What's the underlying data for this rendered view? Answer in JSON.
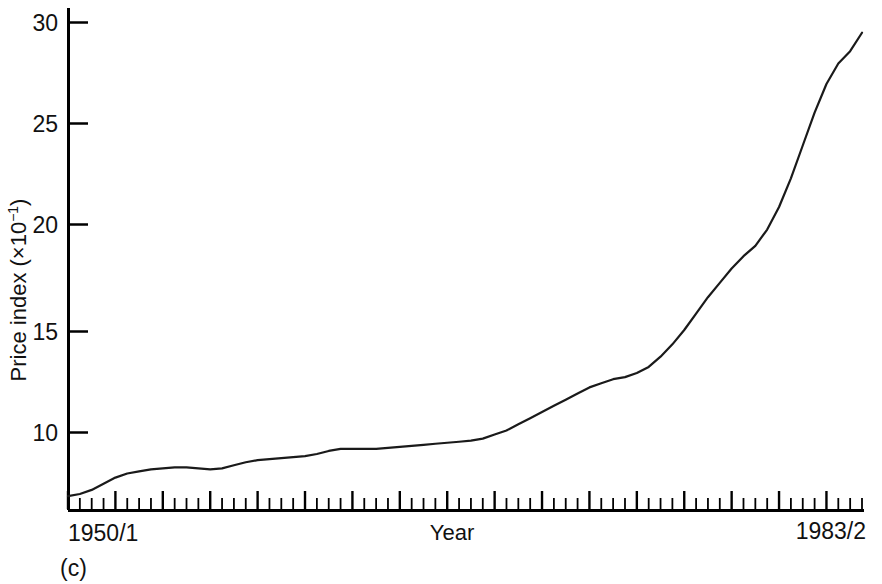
{
  "figure": {
    "caption": "(c)",
    "background_color": "#ffffff",
    "line_color": "#1a1a1a",
    "axis_color": "#000000"
  },
  "chart_data": {
    "type": "line",
    "title": "",
    "subtitle": "",
    "xlabel": "Year",
    "ylabel": "Price index (×10",
    "ylabel_exponent": "−1",
    "ylabel_suffix": ")",
    "ylabel_full": "Price index (×10⁻¹)",
    "grid": false,
    "legend": "none",
    "xlim": [
      0,
      67
    ],
    "ylim": [
      6.2,
      30.5
    ],
    "xtick_labels": [
      "1950/1",
      "1983/2"
    ],
    "xtick_label_positions": [
      0,
      67
    ],
    "x_minor_tick_count": 67,
    "x_major_every": 4,
    "ytick_labels": [
      "10",
      "15",
      "20",
      "25",
      "30"
    ],
    "ytick_values": [
      10,
      15,
      20,
      25,
      30
    ],
    "x_axis_note": "Half-year periods from 1950/1 to 1983/2",
    "series": [
      {
        "name": "Price index",
        "x": [
          0,
          1,
          2,
          3,
          4,
          5,
          6,
          7,
          8,
          9,
          10,
          11,
          12,
          13,
          14,
          15,
          16,
          17,
          18,
          19,
          20,
          21,
          22,
          23,
          24,
          25,
          26,
          27,
          28,
          29,
          30,
          31,
          32,
          33,
          34,
          35,
          36,
          37,
          38,
          39,
          40,
          41,
          42,
          43,
          44,
          45,
          46,
          47,
          48,
          49,
          50,
          51,
          52,
          53,
          54,
          55,
          56,
          57,
          58,
          59,
          60,
          61,
          62,
          63,
          64,
          65,
          66,
          67
        ],
        "x_period_labels": [
          "1950/1",
          "1950/2",
          "1951/1",
          "1951/2",
          "1952/1",
          "1952/2",
          "1953/1",
          "1953/2",
          "1954/1",
          "1954/2",
          "1955/1",
          "1955/2",
          "1956/1",
          "1956/2",
          "1957/1",
          "1957/2",
          "1958/1",
          "1958/2",
          "1959/1",
          "1959/2",
          "1960/1",
          "1960/2",
          "1961/1",
          "1961/2",
          "1962/1",
          "1962/2",
          "1963/1",
          "1963/2",
          "1964/1",
          "1964/2",
          "1965/1",
          "1965/2",
          "1966/1",
          "1966/2",
          "1967/1",
          "1967/2",
          "1968/1",
          "1968/2",
          "1969/1",
          "1969/2",
          "1970/1",
          "1970/2",
          "1971/1",
          "1971/2",
          "1972/1",
          "1972/2",
          "1973/1",
          "1973/2",
          "1974/1",
          "1974/2",
          "1975/1",
          "1975/2",
          "1976/1",
          "1976/2",
          "1977/1",
          "1977/2",
          "1978/1",
          "1978/2",
          "1979/1",
          "1979/2",
          "1980/1",
          "1980/2",
          "1981/1",
          "1981/2",
          "1982/1",
          "1982/2",
          "1983/1",
          "1983/2"
        ],
        "values": [
          6.9,
          7.0,
          7.2,
          7.5,
          7.8,
          8.0,
          8.1,
          8.2,
          8.25,
          8.3,
          8.3,
          8.25,
          8.2,
          8.25,
          8.4,
          8.55,
          8.65,
          8.7,
          8.75,
          8.8,
          8.85,
          8.95,
          9.1,
          9.2,
          9.2,
          9.2,
          9.2,
          9.25,
          9.3,
          9.35,
          9.4,
          9.45,
          9.5,
          9.55,
          9.6,
          9.7,
          9.9,
          10.1,
          10.4,
          10.7,
          11.0,
          11.3,
          11.6,
          11.9,
          12.2,
          12.4,
          12.6,
          12.7,
          12.9,
          13.2,
          13.7,
          14.3,
          15.0,
          15.8,
          16.6,
          17.3,
          18.0,
          18.6,
          19.1,
          19.9,
          21.0,
          22.4,
          24.0,
          25.6,
          27.0,
          28.0,
          28.6,
          29.5
        ]
      }
    ]
  }
}
